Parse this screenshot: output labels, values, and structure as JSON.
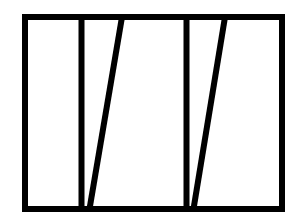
{
  "diagram": {
    "background": "#ffffff",
    "stroke_color": "#000000",
    "stroke_width": 6,
    "outer_rect": {
      "x": 25,
      "y": 17,
      "width": 257,
      "height": 192
    },
    "lines": [
      {
        "id": "vertical-1",
        "x1": 81.5,
        "y1": 17,
        "x2": 81.5,
        "y2": 209
      },
      {
        "id": "diagonal-1",
        "x1": 122,
        "y1": 17,
        "x2": 89.5,
        "y2": 209
      },
      {
        "id": "vertical-2",
        "x1": 186.5,
        "y1": 17,
        "x2": 186.5,
        "y2": 209
      },
      {
        "id": "diagonal-2",
        "x1": 225,
        "y1": 17,
        "x2": 193.5,
        "y2": 209
      }
    ]
  }
}
